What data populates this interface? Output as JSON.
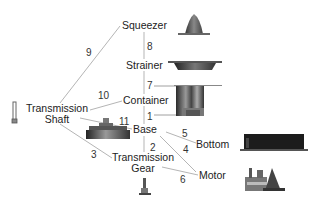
{
  "diagram": {
    "type": "part-relationship-graph",
    "nodes": [
      {
        "id": "squeezer",
        "label": "Squeezer"
      },
      {
        "id": "strainer",
        "label": "Strainer"
      },
      {
        "id": "container",
        "label": "Container"
      },
      {
        "id": "base",
        "label": "Base"
      },
      {
        "id": "bottom",
        "label": "Bottom"
      },
      {
        "id": "motor",
        "label": "Motor"
      },
      {
        "id": "transmission_gear",
        "label_line1": "Transmission",
        "label_line2": "Gear"
      },
      {
        "id": "transmission_shaft",
        "label_line1": "Transmission",
        "label_line2": "Shaft"
      }
    ],
    "edges": [
      {
        "label": "1",
        "from": "container",
        "to": "base"
      },
      {
        "label": "2",
        "from": "base",
        "to": "transmission_gear"
      },
      {
        "label": "3",
        "from": "transmission_shaft",
        "to": "transmission_gear"
      },
      {
        "label": "4",
        "from": "base",
        "to": "motor"
      },
      {
        "label": "5",
        "from": "base",
        "to": "bottom"
      },
      {
        "label": "6",
        "from": "transmission_gear",
        "to": "motor"
      },
      {
        "label": "7",
        "from": "strainer",
        "to": "container"
      },
      {
        "label": "8",
        "from": "squeezer",
        "to": "strainer"
      },
      {
        "label": "9",
        "from": "transmission_shaft",
        "to": "squeezer"
      },
      {
        "label": "10",
        "from": "transmission_shaft",
        "to": "container"
      },
      {
        "label": "11",
        "from": "transmission_shaft",
        "to": "base"
      }
    ],
    "part_images": [
      "squeezer-part",
      "strainer-part",
      "container-part",
      "base-part",
      "bottom-part",
      "motor-part",
      "transmission-gear-part",
      "transmission-shaft-part"
    ]
  }
}
